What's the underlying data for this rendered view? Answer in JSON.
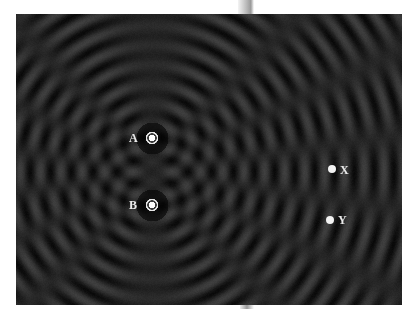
{
  "figure": {
    "sources": [
      {
        "label": "A"
      },
      {
        "label": "B"
      }
    ],
    "points": [
      {
        "label": "X"
      },
      {
        "label": "Y"
      }
    ],
    "colors": {
      "background": "#1c1c1c",
      "crest": "#3c3c3c",
      "trough": "#0a0a0a",
      "marker": "#f2f2f2",
      "page": "#ffffff"
    }
  }
}
